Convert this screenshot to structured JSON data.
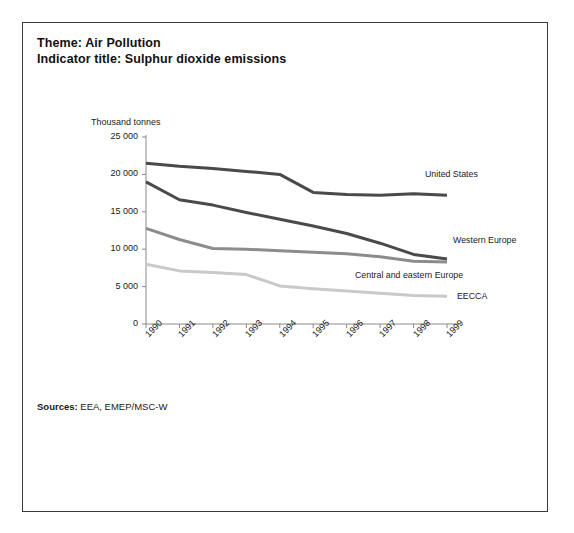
{
  "header": {
    "theme_line": "Theme: Air Pollution",
    "indicator_line": "Indicator title: Sulphur dioxide emissions"
  },
  "footer": {
    "sources_label": "Sources:",
    "sources_value": "EEA, EMEP/MSC-W"
  },
  "chart_data": {
    "type": "line",
    "title": "Sulphur dioxide emissions",
    "xlabel": "",
    "ylabel": "Thousand tonnes",
    "unit_label": "Thousand tonnes",
    "categories": [
      "1990",
      "1991",
      "1992",
      "1993",
      "1994",
      "1995",
      "1996",
      "1997",
      "1998",
      "1999"
    ],
    "x": [
      1990,
      1991,
      1992,
      1993,
      1994,
      1995,
      1996,
      1997,
      1998,
      1999
    ],
    "ylim": [
      0,
      25000
    ],
    "yticks": [
      0,
      5000,
      10000,
      15000,
      20000,
      25000
    ],
    "ytick_labels": [
      "0",
      "5 000",
      "10 000",
      "15 000",
      "20 000",
      "25 000"
    ],
    "grid": false,
    "legend_position": "right-inline",
    "series": [
      {
        "name": "United States",
        "color": "#4a4a4a",
        "values": [
          21500,
          21100,
          20800,
          20400,
          20000,
          17600,
          17300,
          17200,
          17400,
          17200
        ]
      },
      {
        "name": "Western Europe",
        "color": "#4a4a4a",
        "values": [
          19000,
          16600,
          15900,
          14900,
          14000,
          13100,
          12100,
          10800,
          9300,
          8700
        ]
      },
      {
        "name": "Central and eastern Europe",
        "color": "#8c8c8c",
        "values": [
          12800,
          11300,
          10100,
          10000,
          9800,
          9600,
          9400,
          9000,
          8400,
          8300
        ]
      },
      {
        "name": "EECCA",
        "color": "#c9c9c9",
        "values": [
          8000,
          7100,
          6900,
          6600,
          5100,
          4700,
          4400,
          4100,
          3800,
          3700
        ]
      }
    ]
  }
}
